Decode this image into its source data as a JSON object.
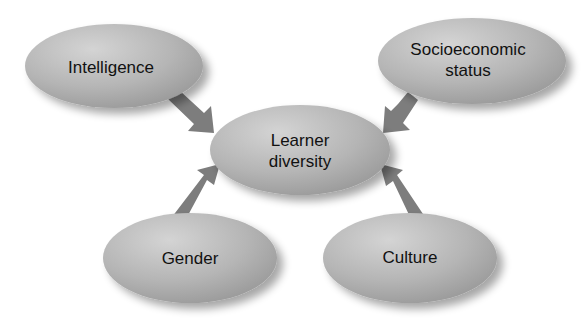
{
  "diagram": {
    "type": "concept-map",
    "colors": {
      "node_fill_light": "#c9c9c9",
      "node_fill_dark": "#9a9a9a",
      "arrow_fill": "#7d7d7d",
      "text": "#111111",
      "background": "#ffffff"
    },
    "center": {
      "id": "learner-diversity",
      "lines": [
        "Learner",
        "diversity"
      ]
    },
    "nodes": [
      {
        "id": "intelligence",
        "lines": [
          "Intelligence"
        ]
      },
      {
        "id": "socioeconomic-status",
        "lines": [
          "Socioeconomic",
          "status"
        ]
      },
      {
        "id": "gender",
        "lines": [
          "Gender"
        ]
      },
      {
        "id": "culture",
        "lines": [
          "Culture"
        ]
      }
    ],
    "edges": [
      {
        "from": "intelligence",
        "to": "learner-diversity"
      },
      {
        "from": "socioeconomic-status",
        "to": "learner-diversity"
      },
      {
        "from": "gender",
        "to": "learner-diversity"
      },
      {
        "from": "culture",
        "to": "learner-diversity"
      }
    ]
  }
}
